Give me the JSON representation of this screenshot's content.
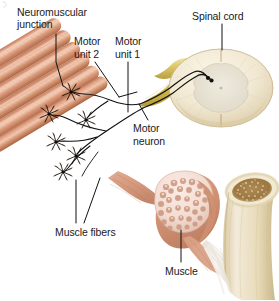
{
  "figure": {
    "width": 279,
    "height": 301,
    "background": "#ffffff"
  },
  "labels": {
    "neuromuscular_junction_line1": "Neuromuscular",
    "neuromuscular_junction_line2": "junction",
    "motor_unit_2_line1": "Motor",
    "motor_unit_2_line2": "unit 2",
    "motor_unit_1_line1": "Motor",
    "motor_unit_1_line2": "unit 1",
    "spinal_cord": "Spinal cord",
    "motor_neuron_line1": "Motor",
    "motor_neuron_line2": "neuron",
    "muscle_fibers": "Muscle fibers",
    "muscle": "Muscle"
  },
  "structures": [
    {
      "name": "muscle-fiber-bundle",
      "description": "Bundle of skeletal muscle fibers, cut ends at upper left"
    },
    {
      "name": "neuromuscular-junctions",
      "description": "Black starburst motor end plates on muscle fibers"
    },
    {
      "name": "motor-neuron-axons",
      "description": "Black axons running from spinal cord to muscle fibers"
    },
    {
      "name": "spinal-nerve-root",
      "description": "Yellow nerve root entering spinal cord"
    },
    {
      "name": "spinal-cord-cross-section",
      "description": "Oval cross-section with butterfly gray matter"
    },
    {
      "name": "muscle-cross-section",
      "description": "Muscle belly cut to show fascicles"
    },
    {
      "name": "bone-cross-section",
      "description": "Cut long bone showing spongy marrow"
    },
    {
      "name": "tendon",
      "description": "Whitish tendon joining muscle to bone"
    }
  ],
  "colors": {
    "text": "#1a1a1a",
    "leader_line": "#111111",
    "muscle_fiber_light": "#e8a98c",
    "muscle_fiber_mid": "#d08f70",
    "muscle_fiber_dark": "#b4714f",
    "muscle_fiber_end": "#f0c3ad",
    "nerve_root_yellow": "#d8c25a",
    "nerve_root_yellow_light": "#ecdc98",
    "spinal_cord_cream": "#efe6cf",
    "spinal_cord_gray_matter": "#e6e2d6",
    "muscle_cross_pink": "#f3ddd4",
    "fascicle": "#d49c84",
    "bone_cream": "#ece0c4",
    "bone_marrow": "#a07c4a",
    "tendon_white": "#f2f0ec",
    "axon_black": "#111111"
  }
}
